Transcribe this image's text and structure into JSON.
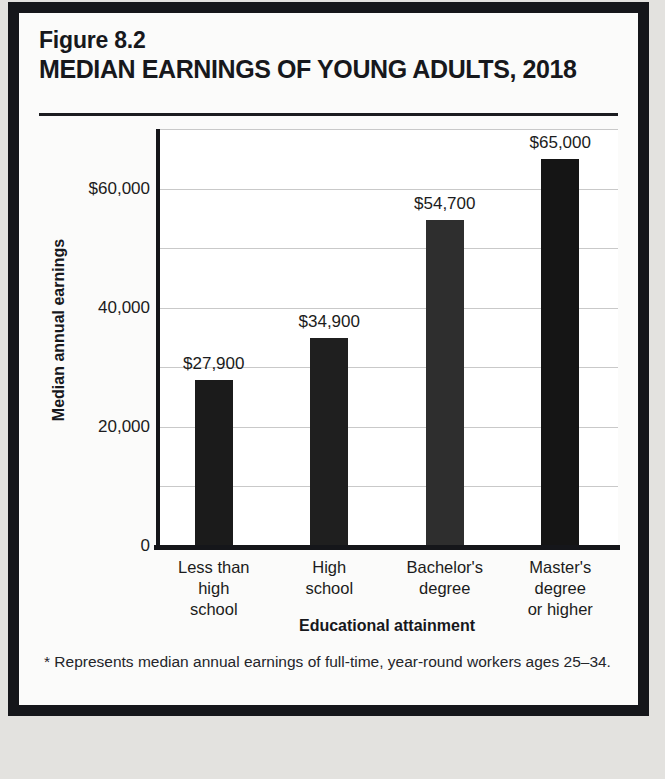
{
  "figure": {
    "number": "Figure 8.2",
    "title": "MEDIAN EARNINGS OF YOUNG ADULTS, 2018",
    "footnote": "* Represents median annual earnings of full-time, year-round workers ages 25–34.",
    "source": "Source: National Center for Education Statistics, 2020."
  },
  "chart_data": {
    "type": "bar",
    "title": "MEDIAN EARNINGS OF YOUNG ADULTS, 2018",
    "xlabel": "Educational attainment",
    "ylabel": "Median annual earnings",
    "categories": [
      "Less than high school",
      "High school",
      "Bachelor's degree",
      "Master's degree or higher"
    ],
    "category_lines": [
      [
        "Less than",
        "high",
        "school"
      ],
      [
        "High",
        "school"
      ],
      [
        "Bachelor's",
        "degree"
      ],
      [
        "Master's",
        "degree",
        "or higher"
      ]
    ],
    "values": [
      27900,
      34900,
      54700,
      65000
    ],
    "value_labels": [
      "$27,900",
      "$34,900",
      "$54,700",
      "$65,000"
    ],
    "bar_colors": [
      "#1b1b1b",
      "#1f1f1f",
      "#2e2e2e",
      "#151515"
    ],
    "ylim": [
      0,
      70000
    ],
    "ytick_values": [
      0,
      20000,
      40000,
      60000
    ],
    "ytick_labels": [
      "0",
      "20,000",
      "40,000",
      "$60,000"
    ],
    "gridline_values": [
      10000,
      20000,
      30000,
      40000,
      50000,
      60000,
      70000
    ],
    "grid": true,
    "legend": "none"
  }
}
